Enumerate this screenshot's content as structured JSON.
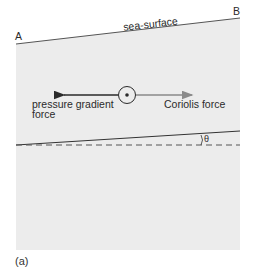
{
  "diagram": {
    "labels": {
      "point_a": "A",
      "point_b": "B",
      "sea_surface": "sea-surface",
      "pressure_gradient_line1": "pressure gradient",
      "pressure_gradient_line2": "force",
      "coriolis": "Coriolis force",
      "angle": "θ",
      "caption": "(a)"
    },
    "colors": {
      "water_fill": "#ececec",
      "pressure_arrow": "#2a2a2a",
      "coriolis_arrow": "#8a8a8a",
      "lines": "#333333"
    }
  }
}
